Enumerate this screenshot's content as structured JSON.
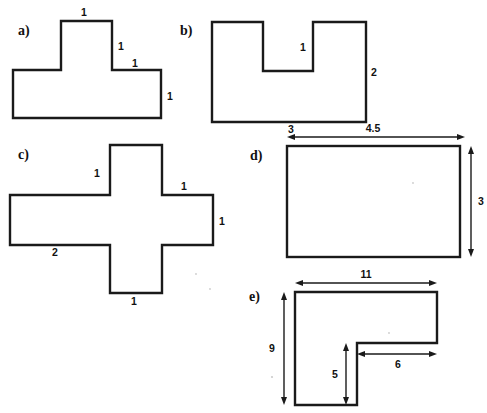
{
  "document": {
    "title": "Geometry shapes worksheet",
    "background_color": "#ffffff",
    "stroke_color": "#1a1a1a",
    "dashed_grid_color": "#8a8a8a",
    "width": 487,
    "height": 413
  },
  "panels": [
    {
      "id": "a",
      "letter": "a)",
      "shape": "T-shape (tetromino made of unit squares)",
      "labels": [
        {
          "key": "a_top",
          "text": "1"
        },
        {
          "key": "a_stem_right",
          "text": "1"
        },
        {
          "key": "a_shoulder_right",
          "text": "1"
        },
        {
          "key": "a_right_side",
          "text": "1"
        }
      ]
    },
    {
      "id": "b",
      "letter": "b)",
      "shape": "U-shape with central notch",
      "labels": [
        {
          "key": "b_notch_width",
          "text": "1"
        },
        {
          "key": "b_right_height",
          "text": "2"
        },
        {
          "key": "b_bottom",
          "text": "3"
        }
      ]
    },
    {
      "id": "c",
      "letter": "c)",
      "shape": "Plus / cross shape of unit squares",
      "labels": [
        {
          "key": "c_top_left",
          "text": "1"
        },
        {
          "key": "c_top_right",
          "text": "1"
        },
        {
          "key": "c_right_side",
          "text": "1"
        },
        {
          "key": "c_bottom_left",
          "text": "2"
        },
        {
          "key": "c_bottom",
          "text": "1"
        }
      ]
    },
    {
      "id": "d",
      "letter": "d)",
      "shape": "Rectangle with dimension arrows",
      "labels": [
        {
          "key": "d_width",
          "text": "4.5"
        },
        {
          "key": "d_height",
          "text": "3"
        }
      ]
    },
    {
      "id": "e",
      "letter": "e)",
      "shape": "L-shape with dimension arrows",
      "labels": [
        {
          "key": "e_top_width",
          "text": "11"
        },
        {
          "key": "e_left_height",
          "text": "9"
        },
        {
          "key": "e_inner_height",
          "text": "5"
        },
        {
          "key": "e_inner_width",
          "text": "6"
        }
      ]
    }
  ],
  "text": {
    "letter_a": "a)",
    "letter_b": "b)",
    "letter_c": "c)",
    "letter_d": "d)",
    "letter_e": "e)",
    "a_top": "1",
    "a_stem_right": "1",
    "a_shoulder_right": "1",
    "a_right_side": "1",
    "b_notch_width": "1",
    "b_right_height": "2",
    "b_bottom": "3",
    "c_top_left": "1",
    "c_top_right": "1",
    "c_right_side": "1",
    "c_bottom_left": "2",
    "c_bottom": "1",
    "d_width": "4.5",
    "d_height": "3",
    "e_top_width": "11",
    "e_left_height": "9",
    "e_inner_height": "5",
    "e_inner_width": "6"
  }
}
